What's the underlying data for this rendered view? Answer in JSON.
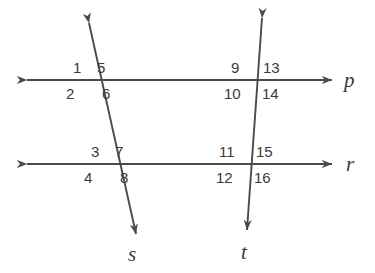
{
  "figure": {
    "type": "geometry-diagram",
    "background_color": "#ffffff",
    "stroke_color": "#4a4a4a",
    "text_color": "#3a3a3a",
    "width": 375,
    "height": 273
  },
  "lines": [
    {
      "name": "p",
      "label": "p",
      "kind": "horizontal",
      "label_x": 344,
      "label_y": 70,
      "x1": 27,
      "y1": 80,
      "x2": 332,
      "y2": 80,
      "arrows": "both"
    },
    {
      "name": "r",
      "label": "r",
      "kind": "horizontal",
      "label_x": 346,
      "label_y": 154,
      "x1": 27,
      "y1": 164,
      "x2": 332,
      "y2": 164,
      "arrows": "both"
    },
    {
      "name": "s",
      "label": "s",
      "kind": "transversal",
      "label_x": 128,
      "label_y": 244,
      "x1": 89,
      "y1": 23,
      "x2": 136,
      "y2": 234,
      "arrows": "both"
    },
    {
      "name": "t",
      "label": "t",
      "kind": "transversal",
      "label_x": 241,
      "label_y": 242,
      "x1": 262,
      "y1": 18,
      "x2": 247,
      "y2": 230,
      "arrows": "both"
    }
  ],
  "intersections": [
    {
      "name": "p-and-s",
      "x": 101,
      "y": 80
    },
    {
      "name": "p-and-t",
      "x": 258,
      "y": 80
    },
    {
      "name": "r-and-s",
      "x": 118,
      "y": 164
    },
    {
      "name": "r-and-t",
      "x": 252,
      "y": 164
    }
  ],
  "angle_labels": [
    {
      "id": "angle-1",
      "text": "1",
      "x": 73,
      "y": 60,
      "intersection": "p-and-s",
      "quadrant": "upper-left"
    },
    {
      "id": "angle-5",
      "text": "5",
      "x": 97,
      "y": 60,
      "intersection": "p-and-s",
      "quadrant": "upper-right"
    },
    {
      "id": "angle-2",
      "text": "2",
      "x": 66,
      "y": 86,
      "intersection": "p-and-s",
      "quadrant": "lower-left"
    },
    {
      "id": "angle-6",
      "text": "6",
      "x": 102,
      "y": 86,
      "intersection": "p-and-s",
      "quadrant": "lower-right"
    },
    {
      "id": "angle-9",
      "text": "9",
      "x": 231,
      "y": 60,
      "intersection": "p-and-t",
      "quadrant": "upper-left"
    },
    {
      "id": "angle-13",
      "text": "13",
      "x": 263,
      "y": 60,
      "intersection": "p-and-t",
      "quadrant": "upper-right"
    },
    {
      "id": "angle-10",
      "text": "10",
      "x": 224,
      "y": 86,
      "intersection": "p-and-t",
      "quadrant": "lower-left"
    },
    {
      "id": "angle-14",
      "text": "14",
      "x": 262,
      "y": 86,
      "intersection": "p-and-t",
      "quadrant": "lower-right"
    },
    {
      "id": "angle-3",
      "text": "3",
      "x": 91,
      "y": 144,
      "intersection": "r-and-s",
      "quadrant": "upper-left"
    },
    {
      "id": "angle-7",
      "text": "7",
      "x": 115,
      "y": 144,
      "intersection": "r-and-s",
      "quadrant": "upper-right"
    },
    {
      "id": "angle-4",
      "text": "4",
      "x": 84,
      "y": 170,
      "intersection": "r-and-s",
      "quadrant": "lower-left"
    },
    {
      "id": "angle-8",
      "text": "8",
      "x": 120,
      "y": 170,
      "intersection": "r-and-s",
      "quadrant": "lower-right"
    },
    {
      "id": "angle-11",
      "text": "11",
      "x": 219,
      "y": 144,
      "intersection": "r-and-t",
      "quadrant": "upper-left"
    },
    {
      "id": "angle-15",
      "text": "15",
      "x": 256,
      "y": 144,
      "intersection": "r-and-t",
      "quadrant": "upper-right"
    },
    {
      "id": "angle-12",
      "text": "12",
      "x": 216,
      "y": 170,
      "intersection": "r-and-t",
      "quadrant": "lower-left"
    },
    {
      "id": "angle-16",
      "text": "16",
      "x": 254,
      "y": 170,
      "intersection": "r-and-t",
      "quadrant": "lower-right"
    }
  ]
}
